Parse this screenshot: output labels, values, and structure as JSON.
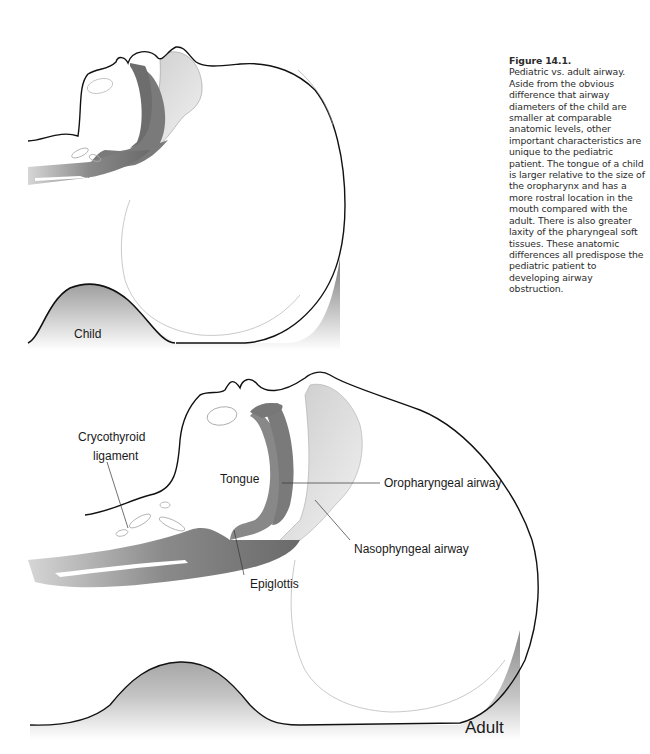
{
  "caption": {
    "figure_number": "Figure 14.1.",
    "text": "Pediatric vs. adult airway. Aside from the obvious difference that airway diameters of the child are smaller at comparable anatomic levels, other important characteristics are unique to the pediatric patient. The tongue of a child is larger relative to the size of the oropharynx and has a more rostral location in the mouth compared with the adult. There is also greater laxity of the pharyngeal soft tissues. These anatomic differences all predispose the pediatric patient to developing airway obstruction."
  },
  "child_panel": {
    "label": "Child"
  },
  "adult_panel": {
    "label": "Adult",
    "annotations": {
      "crycothyroid_line1": "Crycothyroid",
      "crycothyroid_line2": "ligament",
      "tongue": "Tongue",
      "oropharyngeal": "Oropharyngeal airway",
      "nasopharyngeal": "Nasophyngeal airway",
      "epiglottis": "Epiglottis"
    }
  }
}
